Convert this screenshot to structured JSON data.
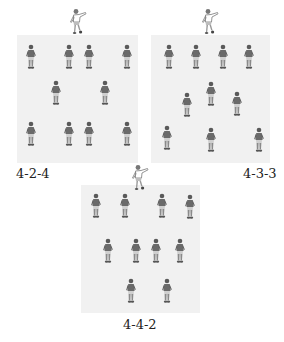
{
  "formations": [
    {
      "label": "4-2-4",
      "pitch": {
        "x": 17,
        "y": 35,
        "w": 121,
        "h": 128
      },
      "keeper": {
        "x": 68,
        "y": 8
      },
      "label_pos": {
        "x": 16,
        "y": 166
      },
      "players": [
        {
          "x": 25,
          "y": 44
        },
        {
          "x": 63,
          "y": 44
        },
        {
          "x": 83,
          "y": 44
        },
        {
          "x": 121,
          "y": 44
        },
        {
          "x": 50,
          "y": 80
        },
        {
          "x": 99,
          "y": 80
        },
        {
          "x": 25,
          "y": 121
        },
        {
          "x": 63,
          "y": 121
        },
        {
          "x": 83,
          "y": 121
        },
        {
          "x": 121,
          "y": 121
        }
      ]
    },
    {
      "label": "4-3-3",
      "pitch": {
        "x": 151,
        "y": 35,
        "w": 119,
        "h": 128
      },
      "keeper": {
        "x": 200,
        "y": 8
      },
      "label_pos": {
        "x": 243,
        "y": 166
      },
      "players": [
        {
          "x": 163,
          "y": 44
        },
        {
          "x": 190,
          "y": 44
        },
        {
          "x": 217,
          "y": 44
        },
        {
          "x": 243,
          "y": 44
        },
        {
          "x": 181,
          "y": 92
        },
        {
          "x": 205,
          "y": 81
        },
        {
          "x": 231,
          "y": 91
        },
        {
          "x": 161,
          "y": 125
        },
        {
          "x": 205,
          "y": 127
        },
        {
          "x": 253,
          "y": 127
        }
      ]
    },
    {
      "label": "4-4-2",
      "pitch": {
        "x": 81,
        "y": 185,
        "w": 119,
        "h": 128
      },
      "keeper": {
        "x": 130,
        "y": 164
      },
      "label_pos": {
        "x": 123,
        "y": 317
      },
      "players": [
        {
          "x": 90,
          "y": 193
        },
        {
          "x": 119,
          "y": 193
        },
        {
          "x": 156,
          "y": 193
        },
        {
          "x": 184,
          "y": 194
        },
        {
          "x": 102,
          "y": 238
        },
        {
          "x": 130,
          "y": 238
        },
        {
          "x": 150,
          "y": 238
        },
        {
          "x": 174,
          "y": 238
        },
        {
          "x": 125,
          "y": 278
        },
        {
          "x": 161,
          "y": 278
        }
      ]
    }
  ],
  "colors": {
    "pitch": "#f1f1f1",
    "player": "#6a6a6a",
    "player_dark": "#4a4a4a",
    "keeper": "#9a9a9a",
    "label": "#222222"
  }
}
